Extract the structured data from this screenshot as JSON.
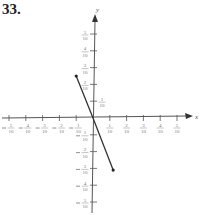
{
  "problem_number": "33.",
  "chart_data": {
    "type": "line",
    "title": "",
    "xlabel": "x",
    "ylabel": "y",
    "x_ticks": [
      "-5/10",
      "-4/10",
      "-3/10",
      "-2/10",
      "-1/10",
      "1/10",
      "2/10",
      "3/10",
      "4/10",
      "5/10"
    ],
    "y_ticks": [
      "-5/10",
      "-4/10",
      "-3/10",
      "-2/10",
      "-1/10",
      "1/10",
      "2/10",
      "3/10",
      "4/10",
      "5/10"
    ],
    "xlim": [
      -0.55,
      0.6
    ],
    "ylim": [
      -0.55,
      0.6
    ],
    "grid": false,
    "series": [
      {
        "name": "segment",
        "points": [
          [
            -0.1,
            0.25
          ],
          [
            0,
            0
          ],
          [
            0.12,
            -0.31
          ]
        ],
        "endpoints_marked": true
      }
    ]
  }
}
